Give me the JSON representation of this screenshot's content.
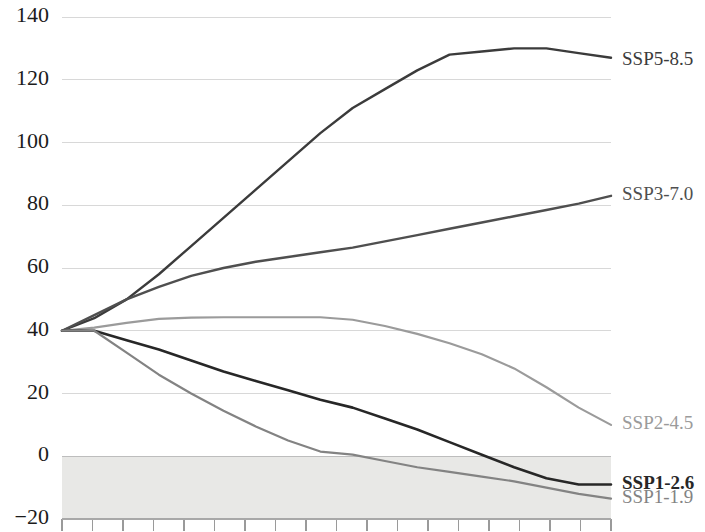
{
  "chart_data": {
    "type": "line",
    "title": "",
    "subtitle": "",
    "xlabel": "",
    "ylabel": "",
    "xlim": [
      2015,
      2100
    ],
    "ylim": [
      -20,
      140
    ],
    "yticks": [
      -20,
      0,
      20,
      40,
      60,
      80,
      100,
      120,
      140
    ],
    "ytick_labels": [
      "−20",
      "0",
      "20",
      "40",
      "60",
      "80",
      "100",
      "120",
      "140"
    ],
    "grid": "horizontal",
    "legend_position": "right-inline-end-of-line",
    "x": [
      2015,
      2020,
      2025,
      2030,
      2035,
      2040,
      2045,
      2050,
      2055,
      2060,
      2065,
      2070,
      2075,
      2080,
      2085,
      2090,
      2095,
      2100
    ],
    "series": [
      {
        "name": "SSP5-8.5",
        "label": "SSP5-8.5",
        "color": "#3b3b3b",
        "width": 2.4,
        "label_bold": false,
        "label_y_value": 126,
        "values": [
          40,
          44,
          50,
          58,
          67,
          76,
          85,
          94,
          103,
          111,
          117,
          123,
          128,
          129,
          130,
          130,
          128.5,
          127
        ]
      },
      {
        "name": "SSP3-7.0",
        "label": "SSP3-7.0",
        "color": "#4f4f4f",
        "width": 2.4,
        "label_bold": false,
        "label_y_value": 83,
        "values": [
          40,
          45,
          50,
          54,
          57.5,
          60,
          62,
          63.5,
          65,
          66.5,
          68.5,
          70.5,
          72.5,
          74.5,
          76.5,
          78.5,
          80.5,
          83
        ]
      },
      {
        "name": "SSP2-4.5",
        "label": "SSP2-4.5",
        "color": "#9b9b9b",
        "width": 2.2,
        "label_bold": false,
        "label_y_value": 10,
        "values": [
          40,
          41,
          42.5,
          43.8,
          44.2,
          44.3,
          44.3,
          44.3,
          44.3,
          43.5,
          41.5,
          39,
          36,
          32.5,
          28,
          22,
          15.5,
          10
        ]
      },
      {
        "name": "SSP1-2.6",
        "label": "SSP1-2.6",
        "color": "#272727",
        "width": 2.6,
        "label_bold": true,
        "label_y_value": -9,
        "values": [
          40,
          40,
          37,
          34,
          30.5,
          27,
          24,
          21,
          18,
          15.5,
          12,
          8.5,
          4.5,
          0.5,
          -3.5,
          -7,
          -9,
          -9
        ]
      },
      {
        "name": "SSP1-1.9",
        "label": "SSP1-1.9",
        "color": "#838383",
        "width": 2.2,
        "label_bold": false,
        "label_y_value": -13.5,
        "values": [
          40,
          40,
          33,
          26,
          20,
          14.5,
          9.5,
          5,
          1.5,
          0.5,
          -1.5,
          -3.5,
          -5,
          -6.5,
          -8,
          -10,
          -12,
          -13.5
        ]
      }
    ],
    "negative_band": {
      "from": -20,
      "to": 0,
      "color": "#e8e8e6"
    },
    "gridline_color": "#d8d8d8",
    "axis_color": "#a8a8a8",
    "tick_count": 18
  },
  "plot": {
    "left": 62,
    "right": 611,
    "top": 17,
    "bottom": 519
  }
}
